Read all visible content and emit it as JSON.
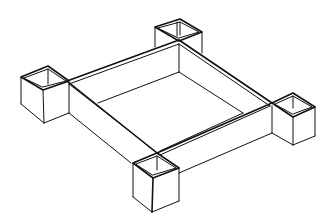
{
  "figure": {
    "title": "",
    "colors": {
      "line": "#111111",
      "background": "#ffffff"
    },
    "components": [
      {
        "name": "back-post",
        "label": ""
      },
      {
        "name": "left-post",
        "label": ""
      },
      {
        "name": "right-post",
        "label": ""
      },
      {
        "name": "front-post",
        "label": ""
      },
      {
        "name": "frame",
        "label": ""
      }
    ]
  }
}
